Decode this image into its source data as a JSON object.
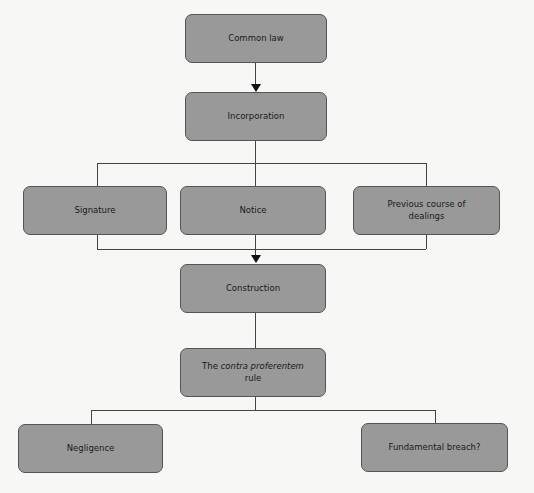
{
  "diagram": {
    "nodes": {
      "common_law": "Common law",
      "incorporation": "Incorporation",
      "signature": "Signature",
      "notice": "Notice",
      "previous_line1": "Previous course of",
      "previous_line2": "dealings",
      "construction": "Construction",
      "contra_prefix": "The ",
      "contra_italic": "contra proferentem",
      "contra_line2": "rule",
      "negligence": "Negligence",
      "fundamental_breach": "Fundamental breach?"
    },
    "colors": {
      "box_fill": "#999999",
      "box_border": "#555555",
      "connector": "#444444",
      "background": "#f7f7f5"
    }
  }
}
